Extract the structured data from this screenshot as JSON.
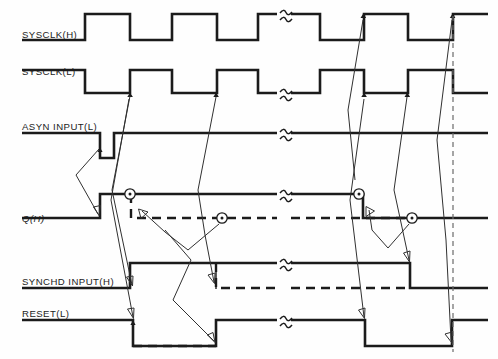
{
  "figure": {
    "kind": "digital-timing-diagram",
    "width": 498,
    "height": 359,
    "background": "#ffffff",
    "line_color": "#1b1b1b",
    "causal_arrow_color": "#303030",
    "dashed_color": "#6a6a6a"
  },
  "signals": [
    {
      "id": "sysclk_h",
      "label": "SYSCLK(H)",
      "label_italic": false,
      "baseline_y": 40,
      "high_y": 14,
      "type": "clock",
      "polarity": "active-high",
      "description": "System clock, true-high"
    },
    {
      "id": "sysclk_l",
      "label": "SYSCLK(L)",
      "label_italic": false,
      "baseline_y": 93,
      "high_y": 70,
      "type": "clock",
      "polarity": "active-low",
      "description": "System clock complement, true-low"
    },
    {
      "id": "asyn_input_l",
      "label": "ASYN INPUT(L)",
      "label_italic": false,
      "baseline_y": 133,
      "low_y": 158,
      "type": "data",
      "polarity": "active-low",
      "description": "Asynchronous input pulse, true-low"
    },
    {
      "id": "q_h",
      "label": "Q(H)",
      "label_italic": true,
      "baseline_y": 218,
      "high_y": 194,
      "type": "data",
      "polarity": "active-high",
      "description": "Flip-flop Q output, true-high"
    },
    {
      "id": "synchd_input_h",
      "label": "SYNCHD INPUT(H)",
      "label_italic": false,
      "baseline_y": 288,
      "high_y": 263,
      "type": "data",
      "polarity": "active-high",
      "description": "Synchronized input, true-high"
    },
    {
      "id": "reset_l",
      "label": "RESET(L)",
      "label_italic": false,
      "baseline_y": 320,
      "low_y": 346,
      "type": "data",
      "polarity": "active-low",
      "description": "Reset strobe, true-low"
    }
  ],
  "time_axis": {
    "start_x": 22,
    "end_x": 488,
    "clock_edges_x": [
      85,
      130,
      172,
      217,
      258,
      320,
      364,
      408,
      453
    ],
    "break_x": 283,
    "break_label": "time-break-squiggle",
    "final_dashed_marker_x": 453
  },
  "markers": {
    "circle_nodes": [
      {
        "x": 130,
        "y": 194,
        "name": "q-set-node"
      },
      {
        "x": 222,
        "y": 218,
        "name": "q-alt-node"
      },
      {
        "x": 359,
        "y": 194,
        "name": "q-set-node-2"
      },
      {
        "x": 412,
        "y": 218,
        "name": "q-alt-node-2"
      }
    ],
    "edge_dots": [
      {
        "x": 130,
        "y": 93
      },
      {
        "x": 216,
        "y": 93
      },
      {
        "x": 363,
        "y": 40
      },
      {
        "x": 364,
        "y": 93
      },
      {
        "x": 407,
        "y": 93
      },
      {
        "x": 453,
        "y": 40
      },
      {
        "x": 100,
        "y": 148
      },
      {
        "x": 133,
        "y": 320
      }
    ]
  },
  "caption": ""
}
